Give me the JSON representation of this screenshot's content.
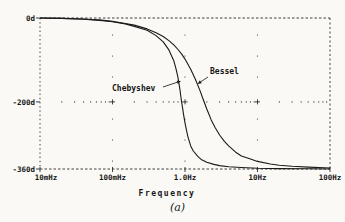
{
  "figure": {
    "caption": "(a)"
  },
  "chart_data": {
    "type": "line",
    "title": "",
    "xlabel": "Frequency",
    "ylabel": "",
    "x_scale": "log",
    "x_range_hz": [
      0.01,
      100
    ],
    "y_range_deg": [
      -360,
      0
    ],
    "grid": "dotted decade verticals; dotted minor-log ticks along -200d; dashed top/bottom borders; dotted left/right borders",
    "legend_position": "inline-annotations",
    "x_ticks": [
      {
        "f": 0.01,
        "label": "10mHz"
      },
      {
        "f": 0.1,
        "label": "100mHz"
      },
      {
        "f": 1,
        "label": "1.0Hz"
      },
      {
        "f": 10,
        "label": "10Hz"
      },
      {
        "f": 100,
        "label": "100Hz"
      }
    ],
    "y_ticks": [
      {
        "v": 0,
        "label": "0d"
      },
      {
        "v": -200,
        "label": "-200d"
      },
      {
        "v": -360,
        "label": "-360d"
      }
    ],
    "series": [
      {
        "name": "Chebyshev",
        "points": [
          [
            0.01,
            0
          ],
          [
            0.02,
            -1
          ],
          [
            0.04,
            -3
          ],
          [
            0.06,
            -5
          ],
          [
            0.08,
            -7
          ],
          [
            0.1,
            -9
          ],
          [
            0.15,
            -14
          ],
          [
            0.2,
            -20
          ],
          [
            0.3,
            -29
          ],
          [
            0.4,
            -42
          ],
          [
            0.5,
            -57
          ],
          [
            0.6,
            -76
          ],
          [
            0.7,
            -102
          ],
          [
            0.75,
            -120
          ],
          [
            0.8,
            -142
          ],
          [
            0.85,
            -170
          ],
          [
            0.88,
            -190
          ],
          [
            0.92,
            -212
          ],
          [
            0.96,
            -232
          ],
          [
            1.0,
            -250
          ],
          [
            1.05,
            -268
          ],
          [
            1.1,
            -284
          ],
          [
            1.2,
            -305
          ],
          [
            1.3,
            -317
          ],
          [
            1.5,
            -330
          ],
          [
            1.7,
            -338
          ],
          [
            2.0,
            -344
          ],
          [
            2.5,
            -349
          ],
          [
            3.0,
            -352
          ],
          [
            4.0,
            -354.5
          ],
          [
            6.0,
            -356.5
          ],
          [
            10,
            -358
          ],
          [
            20,
            -359
          ],
          [
            50,
            -359.6
          ],
          [
            100,
            -360
          ]
        ]
      },
      {
        "name": "Bessel",
        "points": [
          [
            0.01,
            0
          ],
          [
            0.02,
            -1
          ],
          [
            0.04,
            -2.5
          ],
          [
            0.07,
            -5
          ],
          [
            0.1,
            -8
          ],
          [
            0.15,
            -13
          ],
          [
            0.2,
            -17
          ],
          [
            0.3,
            -26
          ],
          [
            0.4,
            -35
          ],
          [
            0.5,
            -44
          ],
          [
            0.6,
            -54
          ],
          [
            0.7,
            -64
          ],
          [
            0.8,
            -75
          ],
          [
            0.9,
            -86
          ],
          [
            1.0,
            -98
          ],
          [
            1.2,
            -122
          ],
          [
            1.4,
            -147
          ],
          [
            1.6,
            -172
          ],
          [
            1.8,
            -196
          ],
          [
            2.0,
            -217
          ],
          [
            2.3,
            -243
          ],
          [
            2.6,
            -261
          ],
          [
            3.0,
            -279
          ],
          [
            3.5,
            -294
          ],
          [
            4.0,
            -305
          ],
          [
            5.0,
            -320
          ],
          [
            6.0,
            -329
          ],
          [
            8.0,
            -336
          ],
          [
            10,
            -342
          ],
          [
            15,
            -348
          ],
          [
            20,
            -351
          ],
          [
            30,
            -353.5
          ],
          [
            50,
            -355.5
          ],
          [
            100,
            -357.5
          ]
        ]
      }
    ],
    "annotations": [
      {
        "text": "Chebyshev",
        "label_x": 112,
        "label_y": 91,
        "tail": [
          163,
          87
        ],
        "tip": [
          181,
          81
        ]
      },
      {
        "text": "Bessel",
        "label_x": 210,
        "label_y": 74,
        "tail": [
          208,
          77
        ],
        "tip": [
          197.5,
          84
        ]
      }
    ],
    "colors": {
      "curve": "#1a1a1a",
      "grid": "#2b2b2b",
      "text": "#161616"
    }
  }
}
